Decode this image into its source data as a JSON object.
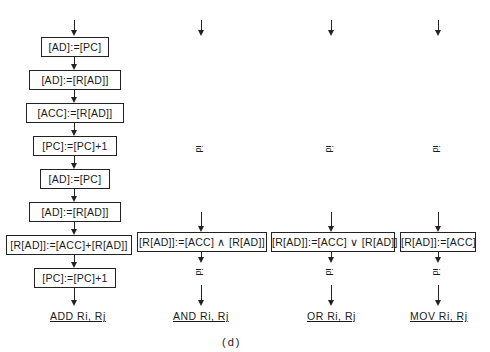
{
  "columns": [
    {
      "name": "add",
      "steps": [
        "[AD]:=[PC]",
        "[AD]:=[R[AD]]",
        "[ACC]:=[R[AD]]",
        "[PC]:=[PC]+1",
        "[AD]:=[PC]",
        "[AD]:=[R[AD]]",
        "[R[AD]]:=[ACC]+[R[AD]]",
        "[PC]:=[PC]+1"
      ],
      "instruction": "ADD  Ri, Rj"
    },
    {
      "name": "and",
      "steps": [
        "[R[AD]]:=[ACC] ∧ [R[AD]]"
      ],
      "marker": "id",
      "instruction": "AND  Ri, Rj"
    },
    {
      "name": "or",
      "steps": [
        "[R[AD]]:=[ACC] ∨ [R[AD]]"
      ],
      "marker": "id",
      "instruction": "OR  Ri, Rj"
    },
    {
      "name": "mov",
      "steps": [
        "[R[AD]]:=[ACC]"
      ],
      "marker": "id",
      "instruction": "MOV  Ri, Rj"
    }
  ],
  "caption": "(d)"
}
